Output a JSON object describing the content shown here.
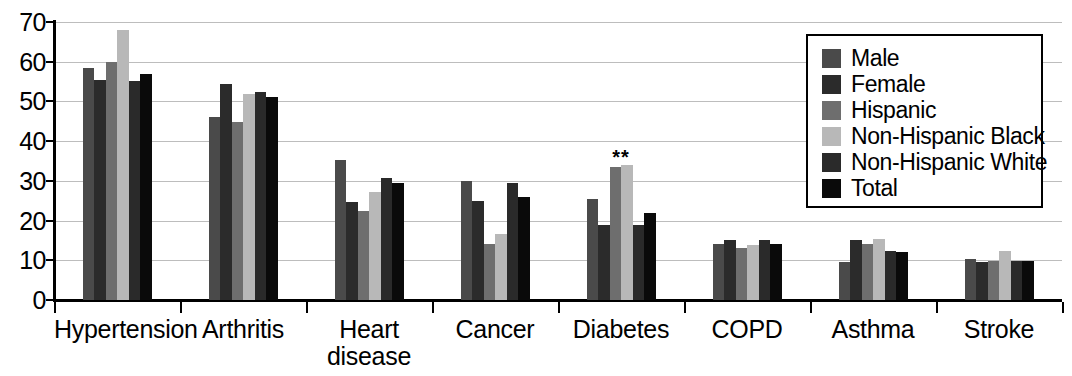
{
  "chart_data": {
    "type": "bar",
    "title": "",
    "xlabel": "",
    "ylabel": "",
    "ylim": [
      0,
      70
    ],
    "yticks": [
      0,
      10,
      20,
      30,
      40,
      50,
      60,
      70
    ],
    "grid": true,
    "legend_position": "top-right",
    "categories": [
      "Hypertension",
      "Arthritis",
      "Heart\ndisease",
      "Cancer",
      "Diabetes",
      "COPD",
      "Asthma",
      "Stroke"
    ],
    "series": [
      {
        "name": "Male",
        "color": "#4a4a4a",
        "values": [
          58.5,
          46.0,
          35.3,
          30.0,
          25.5,
          14.0,
          9.5,
          10.3
        ]
      },
      {
        "name": "Female",
        "color": "#2b2b2b",
        "values": [
          55.4,
          54.5,
          24.7,
          25.0,
          19.0,
          15.0,
          15.0,
          9.5
        ]
      },
      {
        "name": "Hispanic",
        "color": "#6e6e6e",
        "values": [
          60.0,
          44.8,
          22.4,
          14.0,
          33.5,
          13.0,
          14.0,
          9.7
        ]
      },
      {
        "name": "Non-Hispanic Black",
        "color": "#b8b8b8",
        "values": [
          68.0,
          52.0,
          27.3,
          16.7,
          34.0,
          13.8,
          15.3,
          12.3
        ]
      },
      {
        "name": "Non-Hispanic White",
        "color": "#2a2a2a",
        "values": [
          55.2,
          52.3,
          30.7,
          29.5,
          19.0,
          15.2,
          12.3,
          9.8
        ]
      },
      {
        "name": "Total",
        "color": "#0a0a0a",
        "values": [
          57.0,
          51.0,
          29.5,
          26.0,
          22.0,
          14.0,
          12.0,
          9.8
        ]
      }
    ],
    "annotations": [
      {
        "text": "**",
        "category": "Diabetes",
        "series": "Hispanic",
        "value": 33.5
      }
    ]
  },
  "legend": {
    "entries": [
      {
        "label": "Male"
      },
      {
        "label": "Female"
      },
      {
        "label": "Hispanic"
      },
      {
        "label": "Non-Hispanic Black"
      },
      {
        "label": "Non-Hispanic White"
      },
      {
        "label": "Total"
      }
    ]
  }
}
